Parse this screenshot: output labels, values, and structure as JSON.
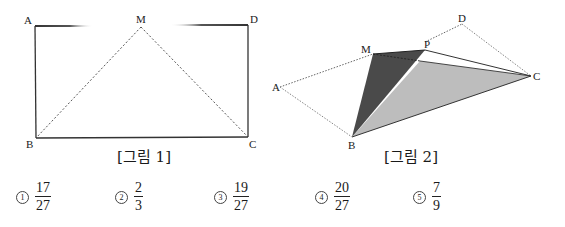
{
  "figure1": {
    "caption": "[그림 1]",
    "labels": {
      "A": "A",
      "M": "M",
      "D": "D",
      "B": "B",
      "C": "C"
    },
    "description": "Rectangle ABCD with M the midpoint of AD; dashed segments MB and MC"
  },
  "figure2": {
    "caption": "[그림 2]",
    "labels": {
      "A": "A",
      "M": "M",
      "P": "P",
      "D": "D",
      "C": "C",
      "B": "B"
    },
    "description": "Folded figure: parallelogram outline A-M-D-C-B dotted; dark triangle M-P-B, light gray triangle B-C-inner point"
  },
  "choices": [
    {
      "marker": "1",
      "numerator": "17",
      "denominator": "27"
    },
    {
      "marker": "2",
      "numerator": "2",
      "denominator": "3"
    },
    {
      "marker": "3",
      "numerator": "19",
      "denominator": "27"
    },
    {
      "marker": "4",
      "numerator": "20",
      "denominator": "27"
    },
    {
      "marker": "5",
      "numerator": "7",
      "denominator": "9"
    }
  ],
  "colors": {
    "dark_face": "#4a4a4a",
    "light_face": "#bdbdbd",
    "line": "#333333"
  }
}
